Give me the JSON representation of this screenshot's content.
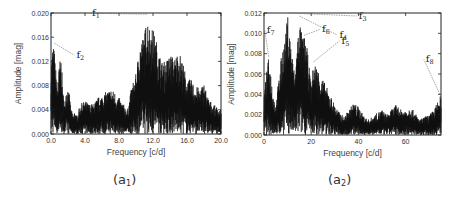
{
  "chart_data": [
    {
      "id": "a1",
      "type": "line",
      "title": "",
      "caption": "(a1)",
      "caption_main": "(a",
      "caption_sub": "1",
      "caption_close": ")",
      "xlabel": "Frequency [c/d]",
      "ylabel": "Amplitude [mag]",
      "xlim": [
        0,
        20
      ],
      "ylim": [
        0,
        0.02
      ],
      "xticks": [
        "0.0",
        "4.0",
        "8.0",
        "12.0",
        "16.0",
        "20.0"
      ],
      "xtick_values": [
        0,
        4,
        8,
        12,
        16,
        20
      ],
      "yticks": [
        "0.000",
        "0.004",
        "0.008",
        "0.012",
        "0.016",
        "0.020"
      ],
      "ytick_values": [
        0,
        0.004,
        0.008,
        0.012,
        0.016,
        0.02
      ],
      "envelope": {
        "x": [
          0.0,
          0.2,
          0.4,
          0.6,
          0.8,
          1.0,
          1.2,
          1.4,
          1.6,
          1.8,
          2.0,
          2.2,
          2.4,
          2.6,
          2.8,
          3.0,
          3.5,
          4.0,
          4.5,
          5.0,
          5.5,
          6.0,
          6.5,
          7.0,
          7.5,
          8.0,
          8.5,
          9.0,
          9.5,
          10.0,
          10.5,
          11.0,
          11.3,
          11.6,
          12.0,
          12.5,
          13.0,
          13.5,
          14.0,
          14.5,
          15.0,
          15.5,
          16.0,
          16.5,
          17.0,
          17.5,
          18.0,
          18.5,
          19.0,
          19.5,
          20.0
        ],
        "y": [
          0.012,
          0.015,
          0.014,
          0.01,
          0.008,
          0.012,
          0.013,
          0.007,
          0.005,
          0.008,
          0.008,
          0.006,
          0.004,
          0.003,
          0.004,
          0.003,
          0.005,
          0.0055,
          0.005,
          0.005,
          0.006,
          0.0065,
          0.007,
          0.0075,
          0.007,
          0.006,
          0.005,
          0.004,
          0.008,
          0.01,
          0.0155,
          0.0165,
          0.02,
          0.018,
          0.0175,
          0.015,
          0.012,
          0.012,
          0.0135,
          0.0125,
          0.014,
          0.012,
          0.009,
          0.009,
          0.008,
          0.0075,
          0.0085,
          0.006,
          0.005,
          0.0045,
          0.004
        ]
      },
      "annotations": [
        {
          "label": "f",
          "sub": "1",
          "x": 11.3,
          "y": 0.0198
        },
        {
          "label": "f",
          "sub": "2",
          "x": 0.4,
          "y": 0.015
        }
      ]
    },
    {
      "id": "a2",
      "type": "line",
      "title": "",
      "caption": "(a2)",
      "caption_main": "(a",
      "caption_sub": "2",
      "caption_close": ")",
      "xlabel": "Frequency [c/d]",
      "ylabel": "Amplitude [mag]",
      "xlim": [
        0,
        75
      ],
      "ylim": [
        0,
        0.012
      ],
      "xticks": [
        "0",
        "20",
        "40",
        "60"
      ],
      "xtick_values": [
        0,
        20,
        40,
        60
      ],
      "yticks": [
        "0.000",
        "0.002",
        "0.004",
        "0.006",
        "0.008",
        "0.010",
        "0.012"
      ],
      "ytick_values": [
        0,
        0.002,
        0.004,
        0.006,
        0.008,
        0.01,
        0.012
      ],
      "envelope": {
        "x": [
          0,
          1,
          2,
          3,
          4,
          5,
          6,
          7,
          8,
          9,
          10,
          11,
          12,
          13,
          14,
          15,
          16,
          17,
          18,
          19,
          20,
          21,
          22,
          24,
          26,
          28,
          30,
          32,
          34,
          36,
          38,
          40,
          42,
          44,
          46,
          48,
          50,
          52,
          54,
          56,
          58,
          60,
          62,
          64,
          66,
          68,
          70,
          72,
          74,
          75
        ],
        "y": [
          0.004,
          0.006,
          0.0077,
          0.006,
          0.004,
          0.003,
          0.005,
          0.007,
          0.009,
          0.0095,
          0.012,
          0.01,
          0.008,
          0.006,
          0.009,
          0.0117,
          0.01,
          0.0098,
          0.009,
          0.007,
          0.005,
          0.0072,
          0.007,
          0.006,
          0.005,
          0.004,
          0.003,
          0.0022,
          0.0018,
          0.0025,
          0.0032,
          0.0028,
          0.002,
          0.0015,
          0.0018,
          0.0022,
          0.0025,
          0.002,
          0.0025,
          0.003,
          0.0025,
          0.0025,
          0.0028,
          0.0022,
          0.0015,
          0.0018,
          0.002,
          0.0025,
          0.0035,
          0.004
        ]
      },
      "annotations": [
        {
          "label": "f",
          "sub": "3",
          "x": 10.5,
          "y": 0.012
        },
        {
          "label": "f",
          "sub": "4",
          "x": 15.0,
          "y": 0.0117
        },
        {
          "label": "f",
          "sub": "5",
          "x": 21.0,
          "y": 0.0072
        },
        {
          "label": "f",
          "sub": "6",
          "x": 17.0,
          "y": 0.0098
        },
        {
          "label": "f",
          "sub": "7",
          "x": 2.0,
          "y": 0.0077
        },
        {
          "label": "f",
          "sub": "8",
          "x": 74.5,
          "y": 0.004
        }
      ]
    }
  ]
}
